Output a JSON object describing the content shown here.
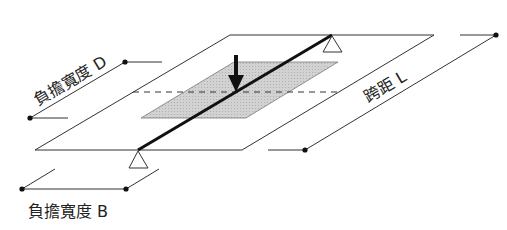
{
  "diagram": {
    "labels": {
      "load_width_d": "負擔寬度 D",
      "span_l": "跨距 L",
      "load_width_b": "負擔寬度 B"
    },
    "elements": {
      "floor_plane": "outer slab plane",
      "tributary_area": "shaded tributary area",
      "beam": "beam",
      "load_arrow": "downward load",
      "supports": [
        "top support",
        "bottom support"
      ],
      "centerline": "dashed centerline"
    },
    "colors": {
      "line": "#222222",
      "shade": "#c8c8c8",
      "background": "#ffffff"
    }
  }
}
